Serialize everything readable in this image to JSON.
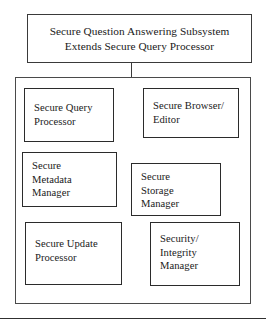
{
  "diagram": {
    "title_box": {
      "text": "Secure Question Answering Subsystem\nExtends Secure Query Processor"
    },
    "components": [
      {
        "id": "secure-query-processor",
        "label": "Secure Query\nProcessor"
      },
      {
        "id": "secure-browser-editor",
        "label": "Secure Browser/\nEditor"
      },
      {
        "id": "secure-metadata-manager",
        "label": "Secure\nMetadata\nManager"
      },
      {
        "id": "secure-storage-manager",
        "label": "Secure\nStorage\nManager"
      },
      {
        "id": "secure-update-processor",
        "label": "Secure Update\nProcessor"
      },
      {
        "id": "security-integrity-manager",
        "label": "Security/\nIntegrity\nManager"
      }
    ],
    "colors": {
      "background": "#ffffff",
      "stroke": "#2b2b2b",
      "text": "#1a1a1a"
    }
  }
}
